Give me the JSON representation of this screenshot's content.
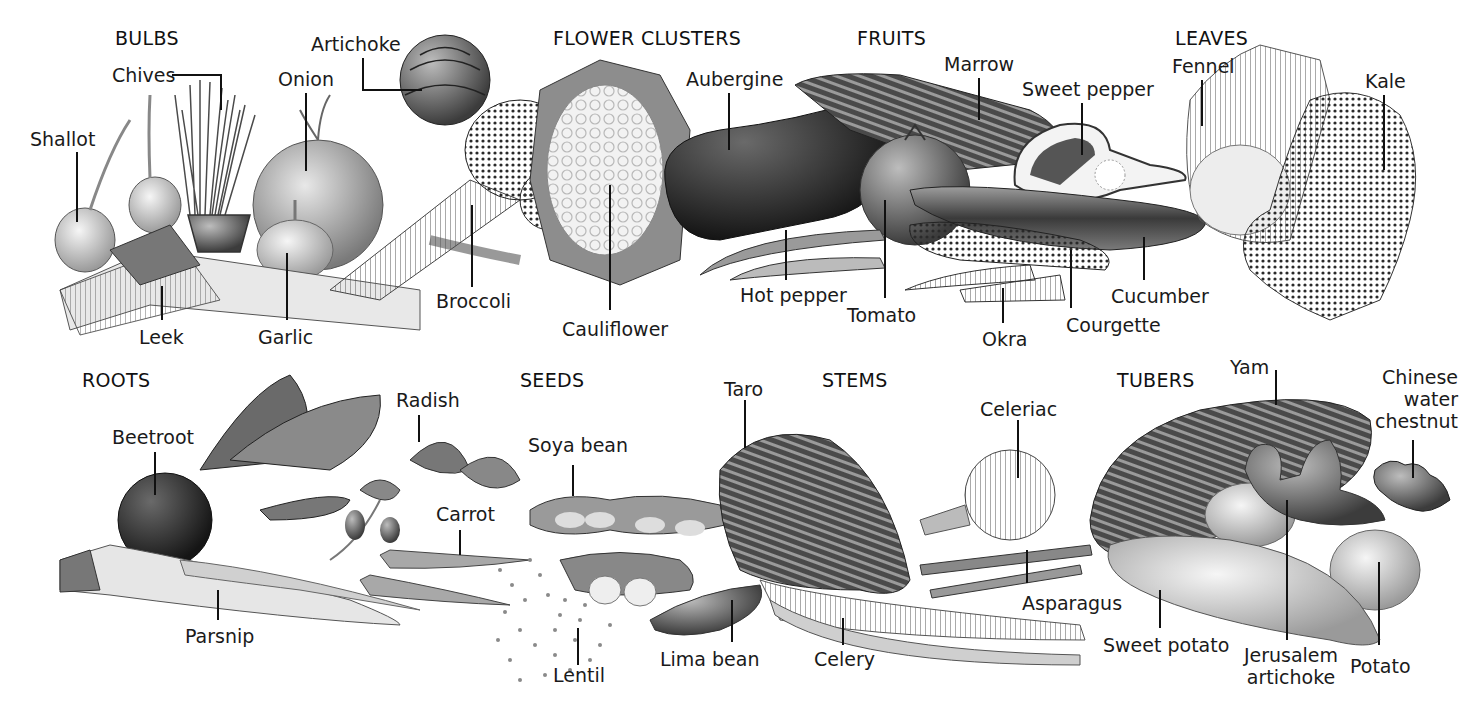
{
  "diagram": {
    "categories": {
      "bulbs": "BULBS",
      "flower_clusters": "FLOWER CLUSTERS",
      "fruits": "FRUITS",
      "leaves": "LEAVES",
      "roots": "ROOTS",
      "seeds": "SEEDS",
      "stems": "STEMS",
      "tubers": "TUBERS"
    },
    "labels": {
      "shallot": "Shallot",
      "chives": "Chives",
      "onion": "Onion",
      "artichoke": "Artichoke",
      "leek": "Leek",
      "garlic": "Garlic",
      "broccoli": "Broccoli",
      "cauliflower": "Cauliflower",
      "aubergine": "Aubergine",
      "marrow": "Marrow",
      "sweet_pepper": "Sweet pepper",
      "hot_pepper": "Hot pepper",
      "tomato": "Tomato",
      "okra": "Okra",
      "courgette": "Courgette",
      "cucumber": "Cucumber",
      "fennel": "Fennel",
      "kale": "Kale",
      "beetroot": "Beetroot",
      "radish": "Radish",
      "carrot": "Carrot",
      "parsnip": "Parsnip",
      "soya_bean": "Soya bean",
      "lentil": "Lentil",
      "lima_bean": "Lima bean",
      "taro": "Taro",
      "celery": "Celery",
      "celeriac": "Celeriac",
      "asparagus": "Asparagus",
      "yam": "Yam",
      "sweet_potato": "Sweet potato",
      "jerusalem_artichoke_1": "Jerusalem",
      "jerusalem_artichoke_2": "artichoke",
      "potato": "Potato",
      "chinese_water_chestnut_1": "Chinese",
      "chinese_water_chestnut_2": "water",
      "chinese_water_chestnut_3": "chestnut"
    }
  }
}
